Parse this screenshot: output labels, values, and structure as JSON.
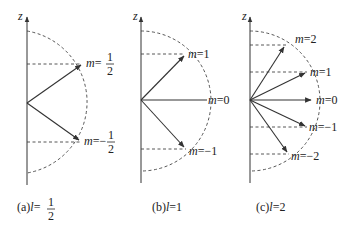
{
  "axis_label": "z",
  "panels": [
    {
      "id": "a",
      "caption_prefix": "(a)",
      "caption_var": "l",
      "caption_eq": "=",
      "caption_num": "1",
      "caption_den": "2",
      "states": [
        {
          "m_label": "m",
          "eq": "=",
          "num": "1",
          "den": "2"
        },
        {
          "m_label": "m",
          "eq": "=−",
          "num": "1",
          "den": "2"
        }
      ]
    },
    {
      "id": "b",
      "caption_prefix": "(b)",
      "caption_var": "l",
      "caption_value": "=1",
      "states": [
        {
          "m_label": "m",
          "value": "=1"
        },
        {
          "m_label": "m",
          "value": "=0"
        },
        {
          "m_label": "m",
          "value": "=−1"
        }
      ]
    },
    {
      "id": "c",
      "caption_prefix": "(c)",
      "caption_var": "l",
      "caption_value": "=2",
      "states": [
        {
          "m_label": "m",
          "value": "=2"
        },
        {
          "m_label": "m",
          "value": "=1"
        },
        {
          "m_label": "m",
          "value": "=0"
        },
        {
          "m_label": "m",
          "value": "=−1"
        },
        {
          "m_label": "m",
          "value": "=−2"
        }
      ]
    }
  ],
  "colors": {
    "line": "#333333",
    "dash": "#444444"
  }
}
